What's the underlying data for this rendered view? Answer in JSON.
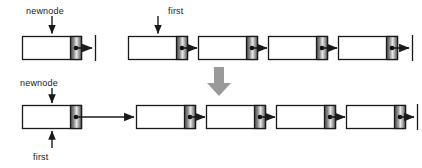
{
  "diagram": {
    "colors": {
      "stroke": "#1a1a1a",
      "node_fill": "#ffffff",
      "next_field_dark": "#4d4d4d",
      "next_field_light": "#e8e8e8",
      "big_arrow": "#9a9a9a",
      "text": "#1a1a1a"
    },
    "labels": [
      {
        "id": "newnode-top",
        "text": "newnode",
        "x": 26,
        "y": 6
      },
      {
        "id": "first-top",
        "text": "first",
        "x": 168,
        "y": 6
      },
      {
        "id": "newnode-bottom",
        "text": "newnode",
        "x": 20,
        "y": 78
      },
      {
        "id": "first-bottom",
        "text": "first",
        "x": 33,
        "y": 152
      }
    ],
    "top_row": {
      "label": "Before insertion",
      "newnode": {
        "x": 22,
        "y": 36,
        "w": 60,
        "h": 24,
        "terminates_null": true
      },
      "list": {
        "label": "existing list",
        "nodes": [
          {
            "x": 128,
            "y": 36,
            "w": 60,
            "h": 24
          },
          {
            "x": 198,
            "y": 36,
            "w": 60,
            "h": 24
          },
          {
            "x": 268,
            "y": 36,
            "w": 60,
            "h": 24
          },
          {
            "x": 338,
            "y": 36,
            "w": 60,
            "h": 24
          }
        ],
        "terminates_null": true
      }
    },
    "transition_arrow": {
      "label": "becomes",
      "x": 219,
      "y_top": 66,
      "y_bottom": 95
    },
    "bottom_row": {
      "label": "After insertion",
      "nodes": [
        {
          "x": 22,
          "y": 105,
          "w": 60,
          "h": 24,
          "long_link": true
        },
        {
          "x": 136,
          "y": 105,
          "w": 60,
          "h": 24
        },
        {
          "x": 206,
          "y": 105,
          "w": 60,
          "h": 24
        },
        {
          "x": 276,
          "y": 105,
          "w": 60,
          "h": 24
        },
        {
          "x": 346,
          "y": 105,
          "w": 60,
          "h": 24
        }
      ],
      "terminates_null": true
    },
    "pointers": [
      {
        "id": "newnode-top-arrow",
        "from_x": 52,
        "from_y": 16,
        "to_x": 52,
        "to_y": 34,
        "direction": "down"
      },
      {
        "id": "first-top-arrow",
        "from_x": 158,
        "from_y": 16,
        "to_x": 158,
        "to_y": 34,
        "direction": "down"
      },
      {
        "id": "newnode-bottom-arrow",
        "from_x": 52,
        "from_y": 88,
        "to_x": 52,
        "to_y": 103,
        "direction": "down"
      },
      {
        "id": "first-bottom-arrow",
        "from_x": 52,
        "from_y": 148,
        "to_x": 52,
        "to_y": 131,
        "direction": "up"
      }
    ]
  }
}
